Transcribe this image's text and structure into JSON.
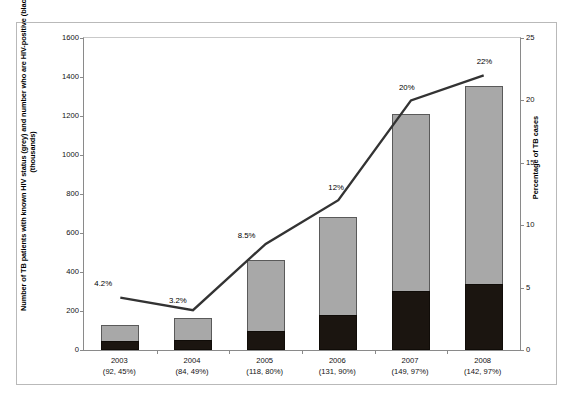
{
  "chart_data": {
    "type": "bar",
    "title": "",
    "subtitle": "",
    "xlabel": "",
    "ylabel": "Number of TB patients with known HIV status (grey) and number who are HIV-positive (black) (thousands)",
    "ylabel_right": "Percentage of TB cases",
    "categories": [
      "2003",
      "2004",
      "2005",
      "2006",
      "2007",
      "2008"
    ],
    "category_sublabels": [
      "(92, 45%)",
      "(84, 49%)",
      "(118, 80%)",
      "(131, 90%)",
      "(149, 97%)",
      "(142, 97%)"
    ],
    "ylim": [
      0,
      1600
    ],
    "yticks": [
      0,
      200,
      400,
      600,
      800,
      1000,
      1200,
      1400,
      1600
    ],
    "ylim_right": [
      0,
      25
    ],
    "yticks_right": [
      0,
      5,
      10,
      15,
      20,
      25
    ],
    "grid": false,
    "legend_position": "none",
    "series": [
      {
        "name": "Number of TB patients with known HIV status (grey)",
        "type": "bar",
        "color": "#a8a8a8",
        "axis": "left",
        "values": [
          130,
          165,
          460,
          680,
          1210,
          1355
        ]
      },
      {
        "name": "Number who are HIV-positive (black)",
        "type": "bar",
        "color": "#1b1510",
        "axis": "left",
        "values": [
          45,
          50,
          100,
          180,
          305,
          340
        ]
      },
      {
        "name": "Percentage of TB cases",
        "type": "line",
        "color": "#333333",
        "axis": "right",
        "values": [
          4.2,
          3.2,
          8.5,
          12,
          20,
          22
        ],
        "data_labels": [
          "4.2%",
          "3.2%",
          "8.5%",
          "12%",
          "20%",
          "22%"
        ]
      }
    ]
  },
  "axes": {
    "left_title": "Number of TB patients with known HIV status (grey) and number who are HIV-positive (black) (thousands)",
    "right_title": "Percentage of TB cases"
  },
  "colors": {
    "bar_grey": "#a8a8a8",
    "bar_black": "#1b1510",
    "line": "#333333",
    "frame": "#b9b9b9",
    "axis": "#8a8a8a"
  }
}
